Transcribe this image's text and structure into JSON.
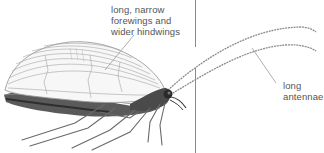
{
  "figure": {
    "labels": [
      {
        "id": "wings",
        "text": "long, narrow\nforewings and\nwider hindwings"
      },
      {
        "id": "antennae",
        "text": "long\nantennae"
      }
    ]
  },
  "colors": {
    "background": "#ffffff",
    "label_text": "#555555",
    "leader_line": "#9a9a9a",
    "divider": "#8a8a8a",
    "wing_vein": "#9c9c9c",
    "body_dark": "#3a3a3a",
    "antenna": "#8c8c8c"
  }
}
